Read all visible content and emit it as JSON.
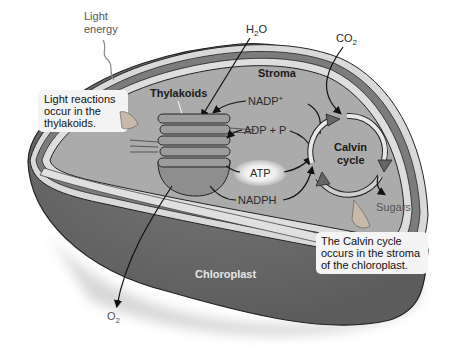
{
  "diagram": {
    "title": "Chloroplast",
    "labels": {
      "light_energy_line1": "Light",
      "light_energy_line2": "energy",
      "h2o": "H",
      "h2o_sub": "2",
      "h2o_tail": "O",
      "co2": "CO",
      "co2_sub": "2",
      "o2": "O",
      "o2_sub": "2",
      "stroma": "Stroma",
      "thylakoids": "Thylakoids",
      "nadp_plus": "NADP",
      "nadp_plus_sup": "+",
      "adp_p": "ADP + P",
      "atp": "ATP",
      "nadph": "NADPH",
      "calvin_line1": "Calvin",
      "calvin_line2": "cycle",
      "sugars": "Sugars",
      "chloroplast": "Chloroplast"
    },
    "callouts": {
      "light_reactions": [
        "Light reactions",
        "occur in the",
        "thylakoids."
      ],
      "calvin": [
        "The Calvin cycle",
        "occurs in the stroma",
        "of the chloroplast."
      ]
    },
    "colors": {
      "stroma_fill": "#a9a9a9",
      "outer_body": "#6e6e6e",
      "membrane_dark": "#7a7a7a",
      "membrane_light": "#d8d8d8",
      "thylakoid_fill": "#8c8c8c",
      "callout_bg": "#f4f4f4"
    }
  }
}
